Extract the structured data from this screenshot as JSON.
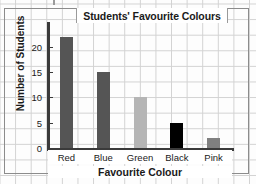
{
  "chart_data": {
    "type": "bar",
    "title": "Students' Favourite Colours",
    "xlabel": "Favourite Colour",
    "ylabel": "Number of Students",
    "categories": [
      "Red",
      "Blue",
      "Green",
      "Black",
      "Pink"
    ],
    "values": [
      22,
      15,
      10,
      5,
      2
    ],
    "bar_colors": [
      "#555555",
      "#555555",
      "#b5b5b5",
      "#000000",
      "#808080"
    ],
    "ylim": [
      0,
      24.5
    ],
    "yticks": [
      0,
      5,
      10,
      15,
      20
    ],
    "ytick_labels": [
      "0",
      "5",
      "10",
      "15",
      "20"
    ],
    "grid": true,
    "grid_style": "graph-paper",
    "legend": "none",
    "axis_color": "#3a3a3a",
    "background_color": "#fdfdfd",
    "gridline_color": "#d2d2d2"
  }
}
